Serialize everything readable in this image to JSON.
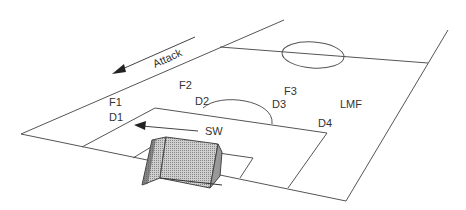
{
  "diagram": {
    "type": "soccer-field-tactics",
    "line_color": "#555555",
    "net_color": "#777777",
    "attack_label": "Attack",
    "players": [
      {
        "label": "F1",
        "x": 109,
        "y": 97
      },
      {
        "label": "F2",
        "x": 179,
        "y": 80
      },
      {
        "label": "F3",
        "x": 284,
        "y": 86
      },
      {
        "label": "D1",
        "x": 109,
        "y": 112
      },
      {
        "label": "D2",
        "x": 195,
        "y": 96
      },
      {
        "label": "D3",
        "x": 272,
        "y": 99
      },
      {
        "label": "D4",
        "x": 318,
        "y": 118
      },
      {
        "label": "LMF",
        "x": 340,
        "y": 99
      },
      {
        "label": "SW",
        "x": 205,
        "y": 126
      }
    ]
  }
}
